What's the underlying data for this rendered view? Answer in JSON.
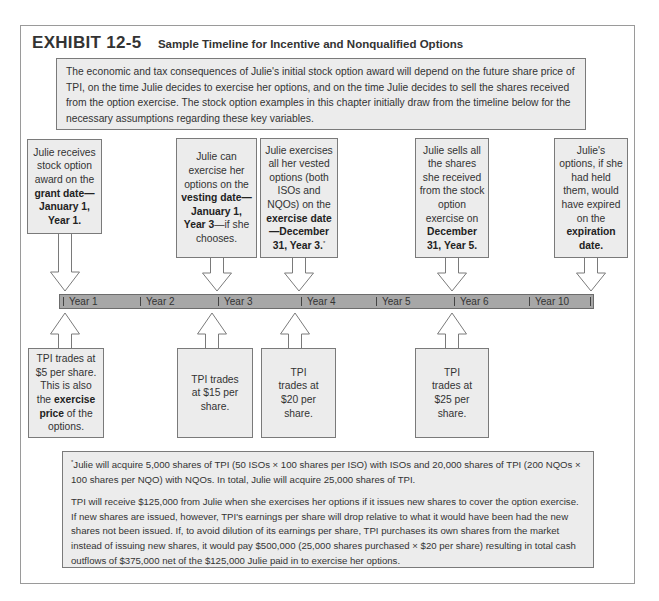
{
  "exhibit": {
    "label": "EXHIBIT 12-5",
    "title": "Sample Timeline for Incentive and Nonqualified Options"
  },
  "intro": "The economic and tax consequences of Julie's initial stock option award will depend on the future share price of TPI, on the time Julie decides to exercise her options, and on the time Julie decides to sell the shares received from the option exercise. The stock option examples in this chapter initially draw from the timeline below for the necessary assumptions regarding these key variables.",
  "events_above": [
    {
      "pre": "Julie receives stock option award on the ",
      "bold": "grant date—January 1, Year 1.",
      "post": "",
      "sup": ""
    },
    {
      "pre": "Julie can exercise her options on the ",
      "bold": "vesting date—January 1, Year 3",
      "post": "—if she chooses.",
      "sup": ""
    },
    {
      "pre": "Julie exercises all her vested options (both ISOs and NQOs) on the ",
      "bold": "exercise date—December 31, Year 3.",
      "post": "",
      "sup": "*"
    },
    {
      "pre": "Julie sells all the shares she received from the stock option exercise on ",
      "bold": "December 31, Year 5.",
      "post": "",
      "sup": ""
    },
    {
      "pre": "Julie's options, if she had held them, would have expired on the ",
      "bold": "expiration date.",
      "post": "",
      "sup": ""
    }
  ],
  "timeline": {
    "ticks": [
      "Year 1",
      "Year 2",
      "Year 3",
      "Year 4",
      "Year 5",
      "Year 6",
      "Year 10"
    ]
  },
  "prices_below": [
    {
      "pre": "TPI trades at $5 per share. This is also the ",
      "bold": "exercise price",
      "post": " of the options."
    },
    {
      "pre": "TPI trades at $15 per share.",
      "bold": "",
      "post": ""
    },
    {
      "pre": "TPI trades at $20 per share.",
      "bold": "",
      "post": ""
    },
    {
      "pre": "TPI trades at $25 per share.",
      "bold": "",
      "post": ""
    }
  ],
  "footnote": {
    "marker": "*",
    "para1": "Julie will acquire 5,000 shares of TPI (50 ISOs × 100 shares per ISO) with ISOs and 20,000 shares of TPI (200 NQOs × 100 shares per NQO) with NQOs. In total, Julie will acquire 25,000 shares of TPI.",
    "para2": "TPI will receive $125,000 from Julie when she exercises her options if it issues new shares to cover the option exercise. If new shares are issued, however, TPI's earnings per share will drop relative to what it would have been had the new shares not been issued. If, to avoid dilution of its earnings per share, TPI purchases its own shares from the market instead of issuing new shares, it would pay $500,000 (25,000 shares purchased × $20 per share) resulting in total cash outflows of $375,000 net of the $125,000 Julie paid in to exercise her options."
  },
  "colors": {
    "box_fill": "#ececec",
    "box_border": "#7a7a7a",
    "timeline_fill": "#a7a7a7"
  }
}
